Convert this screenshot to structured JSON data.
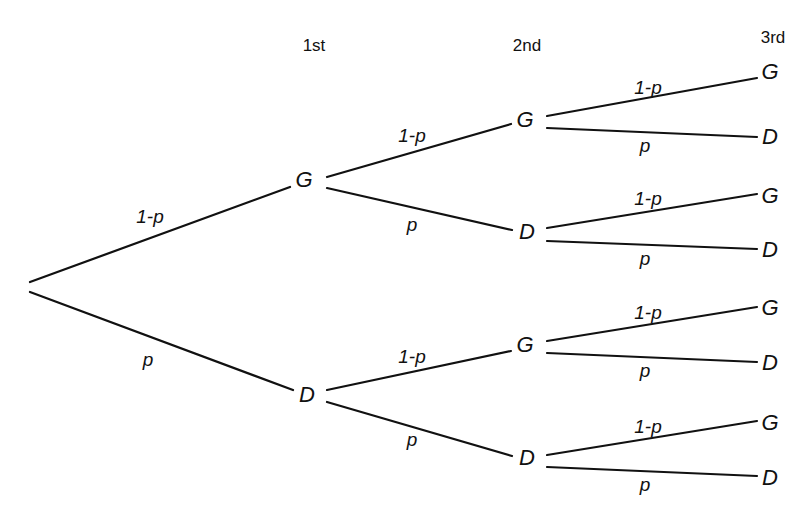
{
  "headers": [
    {
      "text": "1st",
      "x": 314,
      "y": 46
    },
    {
      "text": "2nd",
      "x": 527,
      "y": 46
    },
    {
      "text": "3rd",
      "x": 773,
      "y": 38
    }
  ],
  "nodes": [
    {
      "id": "g1",
      "label": "G",
      "x": 304,
      "y": 180
    },
    {
      "id": "d1",
      "label": "D",
      "x": 307,
      "y": 395
    },
    {
      "id": "g2a",
      "label": "G",
      "x": 525,
      "y": 120
    },
    {
      "id": "d2a",
      "label": "D",
      "x": 527,
      "y": 232
    },
    {
      "id": "g2b",
      "label": "G",
      "x": 525,
      "y": 345
    },
    {
      "id": "d2b",
      "label": "D",
      "x": 527,
      "y": 458
    },
    {
      "id": "g3a",
      "label": "G",
      "x": 770,
      "y": 72
    },
    {
      "id": "d3a",
      "label": "D",
      "x": 770,
      "y": 137
    },
    {
      "id": "g3b",
      "label": "G",
      "x": 770,
      "y": 196
    },
    {
      "id": "d3b",
      "label": "D",
      "x": 770,
      "y": 250
    },
    {
      "id": "g3c",
      "label": "G",
      "x": 770,
      "y": 308
    },
    {
      "id": "d3c",
      "label": "D",
      "x": 770,
      "y": 363
    },
    {
      "id": "g3d",
      "label": "G",
      "x": 770,
      "y": 423
    },
    {
      "id": "d3d",
      "label": "D",
      "x": 770,
      "y": 478
    }
  ],
  "edges": [
    {
      "x1": 30,
      "y1": 282,
      "x2": 290,
      "y2": 187,
      "label": "1-p",
      "lx": 150,
      "ly": 217
    },
    {
      "x1": 30,
      "y1": 292,
      "x2": 293,
      "y2": 390,
      "label": "p",
      "lx": 148,
      "ly": 360
    },
    {
      "x1": 327,
      "y1": 177,
      "x2": 511,
      "y2": 124,
      "label": "1-p",
      "lx": 412,
      "ly": 136
    },
    {
      "x1": 327,
      "y1": 188,
      "x2": 512,
      "y2": 230,
      "label": "p",
      "lx": 412,
      "ly": 225
    },
    {
      "x1": 327,
      "y1": 390,
      "x2": 511,
      "y2": 351,
      "label": "1-p",
      "lx": 412,
      "ly": 357
    },
    {
      "x1": 327,
      "y1": 402,
      "x2": 512,
      "y2": 456,
      "label": "p",
      "lx": 412,
      "ly": 440
    },
    {
      "x1": 547,
      "y1": 116,
      "x2": 757,
      "y2": 78,
      "label": "1-p",
      "lx": 648,
      "ly": 88
    },
    {
      "x1": 547,
      "y1": 128,
      "x2": 757,
      "y2": 137,
      "label": "p",
      "lx": 645,
      "ly": 146
    },
    {
      "x1": 547,
      "y1": 228,
      "x2": 757,
      "y2": 194,
      "label": "1-p",
      "lx": 648,
      "ly": 199
    },
    {
      "x1": 547,
      "y1": 241,
      "x2": 757,
      "y2": 249,
      "label": "p",
      "lx": 645,
      "ly": 259
    },
    {
      "x1": 547,
      "y1": 341,
      "x2": 757,
      "y2": 307,
      "label": "1-p",
      "lx": 648,
      "ly": 313
    },
    {
      "x1": 547,
      "y1": 353,
      "x2": 757,
      "y2": 362,
      "label": "p",
      "lx": 645,
      "ly": 371
    },
    {
      "x1": 547,
      "y1": 455,
      "x2": 757,
      "y2": 421,
      "label": "1-p",
      "lx": 648,
      "ly": 427
    },
    {
      "x1": 547,
      "y1": 467,
      "x2": 757,
      "y2": 476,
      "label": "p",
      "lx": 645,
      "ly": 485
    }
  ]
}
